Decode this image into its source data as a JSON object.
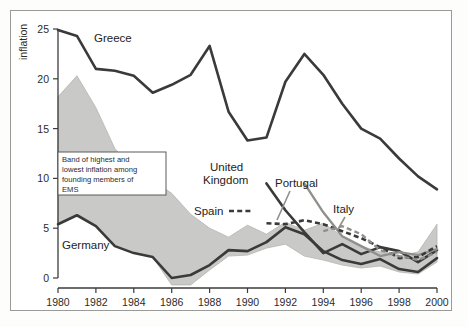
{
  "chart_data": {
    "type": "line",
    "title": "",
    "xlabel": "",
    "ylabel": "inflation",
    "xlim": [
      1980,
      2000
    ],
    "ylim": [
      0,
      25
    ],
    "grid": false,
    "legend_position": "inline-labels",
    "x_ticks": [
      "1980",
      "1982",
      "1984",
      "1986",
      "1988",
      "1990",
      "1992",
      "1994",
      "1996",
      "1998",
      "2000"
    ],
    "y_ticks": [
      "0",
      "5",
      "10",
      "15",
      "20",
      "25"
    ],
    "x": [
      1980,
      1981,
      1982,
      1983,
      1984,
      1985,
      1986,
      1987,
      1988,
      1989,
      1990,
      1991,
      1992,
      1993,
      1994,
      1995,
      1996,
      1997,
      1998,
      1999,
      2000
    ],
    "series": [
      {
        "name": "Greece",
        "style": "solid-dark",
        "color": "#3a3a3a",
        "x": [
          1980,
          1981,
          1982,
          1983,
          1984,
          1985,
          1986,
          1987,
          1988,
          1989,
          1990,
          1991,
          1992,
          1993,
          1994,
          1995,
          1996,
          1997,
          1998,
          1999,
          2000
        ],
        "values": [
          24.9,
          24.3,
          21.0,
          20.8,
          20.3,
          18.6,
          19.4,
          20.4,
          23.3,
          16.7,
          13.8,
          14.1,
          19.7,
          22.5,
          20.4,
          17.5,
          15.0,
          14.0,
          12.0,
          10.2,
          8.9
        ]
      },
      {
        "name": "Germany",
        "style": "solid-dark",
        "color": "#3a3a3a",
        "x": [
          1980,
          1981,
          1982,
          1983,
          1984,
          1985,
          1986,
          1987,
          1988,
          1989,
          1990,
          1991,
          1992,
          1993,
          1994,
          1995,
          1996,
          1997,
          1998,
          1999,
          2000
        ],
        "values": [
          5.4,
          6.3,
          5.2,
          3.2,
          2.5,
          2.1,
          0.0,
          0.3,
          1.3,
          2.8,
          2.7,
          3.6,
          5.1,
          4.4,
          2.7,
          1.8,
          1.4,
          1.9,
          0.9,
          0.6,
          2.0
        ]
      },
      {
        "name": "United Kingdom",
        "style": "solid-dark",
        "color": "#3a3a3a",
        "x": [
          1991,
          1992,
          1993,
          1994,
          1995,
          1996,
          1997,
          1998,
          1999,
          2000
        ],
        "values": [
          9.5,
          6.8,
          4.6,
          2.5,
          3.4,
          2.4,
          3.1,
          2.7,
          1.6,
          2.8
        ]
      },
      {
        "name": "Portugal",
        "style": "solid-gray",
        "color": "#8f8f8c",
        "x": [
          1993,
          1994,
          1995,
          1996,
          1997,
          1998,
          1999,
          2000
        ],
        "values": [
          9.5,
          6.6,
          4.2,
          3.2,
          2.2,
          2.6,
          2.3,
          2.9
        ]
      },
      {
        "name": "Spain",
        "style": "dashed-dark",
        "color": "#3a3a3a",
        "x": [
          1991,
          1992,
          1993,
          1994,
          1995,
          1996,
          1997,
          1998,
          1999,
          2000
        ],
        "values": [
          5.5,
          5.4,
          5.8,
          5.4,
          4.7,
          4.0,
          3.1,
          2.0,
          2.1,
          3.2
        ]
      },
      {
        "name": "Italy",
        "style": "dashed-gray",
        "color": "#8f8f8c",
        "x": [
          1994,
          1995,
          1996,
          1997,
          1998,
          1999,
          2000
        ],
        "values": [
          4.7,
          5.2,
          4.4,
          2.8,
          2.2,
          1.8,
          2.6
        ]
      }
    ],
    "band": {
      "name": "Band of highest and lowest inflation among founding members of EMS",
      "color": "#c9c9c7",
      "x": [
        1980,
        1981,
        1982,
        1983,
        1984,
        1985,
        1986,
        1987,
        1988,
        1989,
        1990,
        1991,
        1992,
        1993,
        1994,
        1995,
        1996,
        1997,
        1998,
        1999,
        2000
      ],
      "upper": [
        18.2,
        20.3,
        17.1,
        13.0,
        10.8,
        9.8,
        8.5,
        6.4,
        5.0,
        4.1,
        5.3,
        4.4,
        5.6,
        4.8,
        5.5,
        4.2,
        3.2,
        2.6,
        2.2,
        2.6,
        5.4
      ],
      "lower": [
        5.4,
        6.3,
        5.2,
        3.2,
        2.5,
        2.1,
        -0.7,
        -0.7,
        0.8,
        2.2,
        2.3,
        3.0,
        3.4,
        2.2,
        1.8,
        1.3,
        1.0,
        1.2,
        0.6,
        0.4,
        1.6
      ]
    },
    "annotations": [
      {
        "name": "band-annotation",
        "lines": [
          "Band of highest and",
          "lowest inflation among",
          "founding members of",
          "EMS"
        ]
      }
    ]
  },
  "labels": {
    "greece": "Greece",
    "germany": "Germany",
    "united_kingdom_line1": "United",
    "united_kingdom_line2": "Kingdom",
    "portugal": "Portugal",
    "spain": "Spain",
    "italy": "Italy",
    "y_axis_title": "inflation"
  },
  "annotation_text": {
    "line1": "Band of highest and",
    "line2": "lowest inflation among",
    "line3": "founding members of",
    "line4": "EMS"
  },
  "axis": {
    "x_ticks": [
      "1980",
      "1982",
      "1984",
      "1986",
      "1988",
      "1990",
      "1992",
      "1994",
      "1996",
      "1998",
      "2000"
    ],
    "y_ticks": [
      "0",
      "5",
      "10",
      "15",
      "20",
      "25"
    ]
  },
  "colors": {
    "band_fill": "#c9c9c7",
    "dark_line": "#3a3a3a",
    "gray_line": "#8f8f8c",
    "frame": "#9a9a96"
  }
}
